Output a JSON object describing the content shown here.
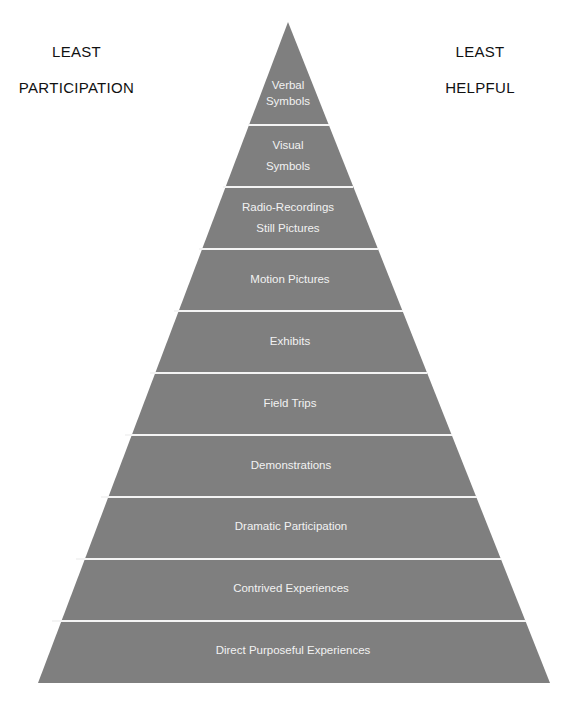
{
  "labels": {
    "left": [
      "LEAST",
      "PARTICIPATION"
    ],
    "right": [
      "LEAST",
      "HELPFUL"
    ]
  },
  "colors": {
    "layer_fill": "#7f7f7f",
    "separator": "#f4f4f4",
    "layer_text": "#f2f2f2",
    "side_text": "#111111"
  },
  "pyramid": {
    "title": "Cone of Experience",
    "layers": [
      {
        "line1": "Verbal",
        "line2": "Symbols"
      },
      {
        "line1": "Visual",
        "line2": "Symbols"
      },
      {
        "line1": "Radio-Recordings",
        "line2": "Still Pictures"
      },
      {
        "line1": "Motion Pictures",
        "line2": ""
      },
      {
        "line1": "Exhibits",
        "line2": ""
      },
      {
        "line1": "Field Trips",
        "line2": ""
      },
      {
        "line1": "Demonstrations",
        "line2": ""
      },
      {
        "line1": "Dramatic Participation",
        "line2": ""
      },
      {
        "line1": "Contrived Experiences",
        "line2": ""
      },
      {
        "line1": "Direct Purposeful Experiences",
        "line2": ""
      }
    ]
  }
}
